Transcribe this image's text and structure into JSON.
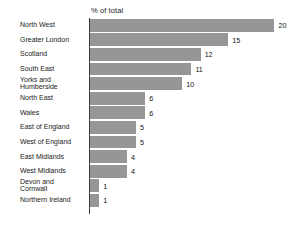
{
  "chart_data": {
    "type": "bar",
    "orientation": "horizontal",
    "title": "% of total",
    "xlabel": "",
    "ylabel": "",
    "xlim": [
      0,
      20
    ],
    "grid": false,
    "legend": false,
    "categories": [
      "North West",
      "Greater London",
      "Scotland",
      "South East",
      "Yorks and\nHumberside",
      "North East",
      "Wales",
      "East of England",
      "West of England",
      "East Midlands",
      "West Midlands",
      "Devon and\nCornwall",
      "Northern Ireland"
    ],
    "values": [
      20,
      15,
      12,
      11,
      10,
      6,
      6,
      5,
      5,
      4,
      4,
      1,
      1
    ],
    "value_labels": [
      "20",
      "15",
      "12",
      "11",
      "10",
      "6",
      "6",
      "5",
      "5",
      "4",
      "4",
      "1",
      "1"
    ],
    "bar_color": "#969696",
    "axis_color": "#3d3d3d",
    "text_color": "#1a1a1a"
  }
}
